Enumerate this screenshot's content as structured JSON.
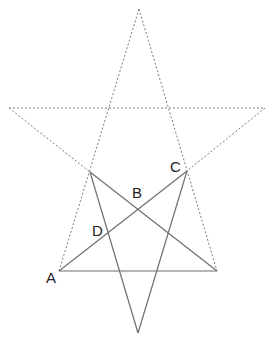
{
  "diagram": {
    "colors": {
      "dashed_line": "#7a7a7a",
      "solid_line": "#6e6e6e",
      "label": "#222222",
      "background": "#ffffff"
    },
    "points": {
      "top": [
        139,
        9
      ],
      "left_tip": [
        9,
        108
      ],
      "right_tip": [
        265,
        108
      ],
      "A": [
        59,
        271
      ],
      "bottom_right": [
        217,
        271
      ],
      "upper_left_inner": [
        90,
        172
      ],
      "C": [
        187,
        171
      ],
      "bottom": [
        138,
        333
      ],
      "B": [
        137,
        203
      ],
      "D": [
        107,
        235
      ]
    },
    "labels": [
      {
        "id": "A",
        "text": "A",
        "x": 46,
        "y": 283
      },
      {
        "id": "B",
        "text": "B",
        "x": 132,
        "y": 198
      },
      {
        "id": "C",
        "text": "C",
        "x": 170,
        "y": 172
      },
      {
        "id": "D",
        "text": "D",
        "x": 92,
        "y": 235
      }
    ]
  }
}
